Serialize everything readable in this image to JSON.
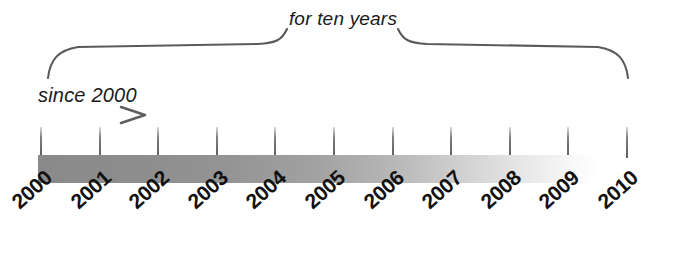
{
  "diagram": {
    "type": "timeline",
    "title_caption": "for ten years",
    "arrow_caption": "since 2000",
    "background_color": "#ffffff",
    "bar": {
      "start_color": "#8a8a8a",
      "end_color": "#ffffff",
      "start_year": "2000",
      "fade_out_year": "2009"
    },
    "brace": {
      "label": "for ten years",
      "span_start_year": "2000",
      "span_end_year": "2010",
      "color": "#5a5a5a"
    },
    "arrow": {
      "label": "since 2000",
      "direction": "right",
      "color": "#7a7a7a"
    }
  },
  "chart_data": {
    "type": "line",
    "title": "for ten years",
    "xlabel": "",
    "ylabel": "",
    "categories": [
      "2000",
      "2001",
      "2002",
      "2003",
      "2004",
      "2005",
      "2006",
      "2007",
      "2008",
      "2009",
      "2010"
    ],
    "values": [
      0,
      0,
      0,
      0,
      0,
      0,
      0,
      0,
      0,
      0,
      0
    ],
    "annotations": [
      "since 2000",
      "for ten years"
    ],
    "grid": false,
    "legend_position": "none"
  },
  "axis": {
    "tick_labels": [
      "2000",
      "2001",
      "2002",
      "2003",
      "2004",
      "2005",
      "2006",
      "2007",
      "2008",
      "2009",
      "2010"
    ],
    "tick_count": 11,
    "label_rotation_degrees": "-42"
  }
}
